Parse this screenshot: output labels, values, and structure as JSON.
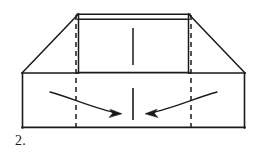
{
  "diagram": {
    "kind": "origami-fold-instruction",
    "step_label": "2.",
    "caption": "",
    "background_color": "#ffffff",
    "ink_color": "#1a1a1a",
    "line_styles": {
      "edge": "solid",
      "crease": "dashed",
      "fold_motion": "curved-arrow"
    },
    "canvas": {
      "width": 265,
      "height": 153
    },
    "shapes": {
      "base_rectangle": {
        "name": "lower-base-panel",
        "x1": 22,
        "y1": 73,
        "x2": 245,
        "y2": 128,
        "style": "solid"
      },
      "center_panel": {
        "name": "raised-center-panel",
        "x1": 78,
        "y1": 14,
        "x2": 189,
        "y2": 73,
        "style": "solid",
        "double_top_edge": true,
        "top_edge_offset": 5
      },
      "left_diagonal": {
        "name": "left-diagonal-fold",
        "x1": 22,
        "y1": 73,
        "x2": 78,
        "y2": 14,
        "style": "solid"
      },
      "right_diagonal": {
        "name": "right-diagonal-fold",
        "x1": 189,
        "y1": 14,
        "x2": 245,
        "y2": 73,
        "style": "solid"
      }
    },
    "creases": [
      {
        "name": "left-vertical-crease",
        "x": 76,
        "y1": 15,
        "y2": 128,
        "style": "dashed"
      },
      {
        "name": "right-vertical-crease",
        "x": 191,
        "y1": 15,
        "y2": 128,
        "style": "dashed"
      }
    ],
    "center_marks": [
      {
        "name": "upper-center-mark",
        "x": 133,
        "y1": 28,
        "y2": 65,
        "style": "solid"
      },
      {
        "name": "lower-center-mark",
        "x": 133,
        "y1": 88,
        "y2": 120,
        "style": "solid"
      }
    ],
    "arrows": [
      {
        "name": "left-fold-arrow",
        "direction": "rightward",
        "path": "M 50,92 C 74,99 98,110 116,113",
        "head_at": {
          "x": 118,
          "y": 113
        },
        "head_angle": 12
      },
      {
        "name": "right-fold-arrow",
        "direction": "leftward",
        "path": "M 217,92 C 193,99 169,110 151,113",
        "head_at": {
          "x": 149,
          "y": 113
        },
        "head_angle": 168
      }
    ]
  }
}
